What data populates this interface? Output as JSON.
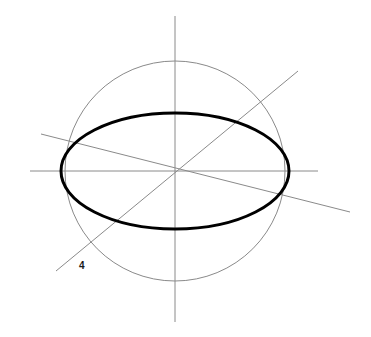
{
  "figure": {
    "title": "",
    "width": 371,
    "height": 337,
    "background_color": "#ffffff"
  },
  "colors": {
    "ellipse_stroke": "#000000",
    "circle_stroke": "#8a8a8a",
    "line_stroke": "#8a8a8a",
    "label_color": "#1a1a1a"
  },
  "geometry": {
    "center": {
      "x": 175,
      "y": 171
    },
    "circle": {
      "cx": 175,
      "cy": 171,
      "r": 110,
      "stroke_width": 1
    },
    "ellipse": {
      "cx": 175,
      "cy": 171,
      "rx": 114,
      "ry": 58,
      "stroke_width": 3
    },
    "lines": [
      {
        "name": "vertical-axis",
        "x1": 175,
        "y1": 16,
        "x2": 175,
        "y2": 322,
        "stroke_width": 1
      },
      {
        "name": "horizontal-axis",
        "x1": 30,
        "y1": 171,
        "x2": 318,
        "y2": 171,
        "stroke_width": 1
      },
      {
        "name": "steep-diagonal",
        "x1": 56,
        "y1": 271,
        "x2": 298,
        "y2": 71,
        "stroke_width": 1
      },
      {
        "name": "shallow-diagonal",
        "x1": 41,
        "y1": 134,
        "x2": 350,
        "y2": 212,
        "stroke_width": 1
      }
    ]
  },
  "labels": [
    {
      "name": "label-4",
      "text": "4",
      "x": 79,
      "y": 261
    }
  ],
  "chart_data": {
    "type": "diagram",
    "title": "",
    "shapes": [
      {
        "kind": "circle",
        "center": [
          175,
          171
        ],
        "radius": 110,
        "style": "thin-gray"
      },
      {
        "kind": "ellipse",
        "center": [
          175,
          171
        ],
        "semi_major": 114,
        "semi_minor": 58,
        "rotation_deg": 0,
        "style": "thick-black"
      },
      {
        "kind": "line",
        "from": [
          175,
          16
        ],
        "to": [
          175,
          322
        ],
        "style": "thin-gray"
      },
      {
        "kind": "line",
        "from": [
          30,
          171
        ],
        "to": [
          318,
          171
        ],
        "style": "thin-gray"
      },
      {
        "kind": "line",
        "from": [
          56,
          271
        ],
        "to": [
          298,
          71
        ],
        "style": "thin-gray"
      },
      {
        "kind": "line",
        "from": [
          41,
          134
        ],
        "to": [
          350,
          212
        ],
        "style": "thin-gray"
      }
    ],
    "annotations": [
      {
        "text": "4",
        "at": [
          79,
          261
        ]
      }
    ]
  }
}
